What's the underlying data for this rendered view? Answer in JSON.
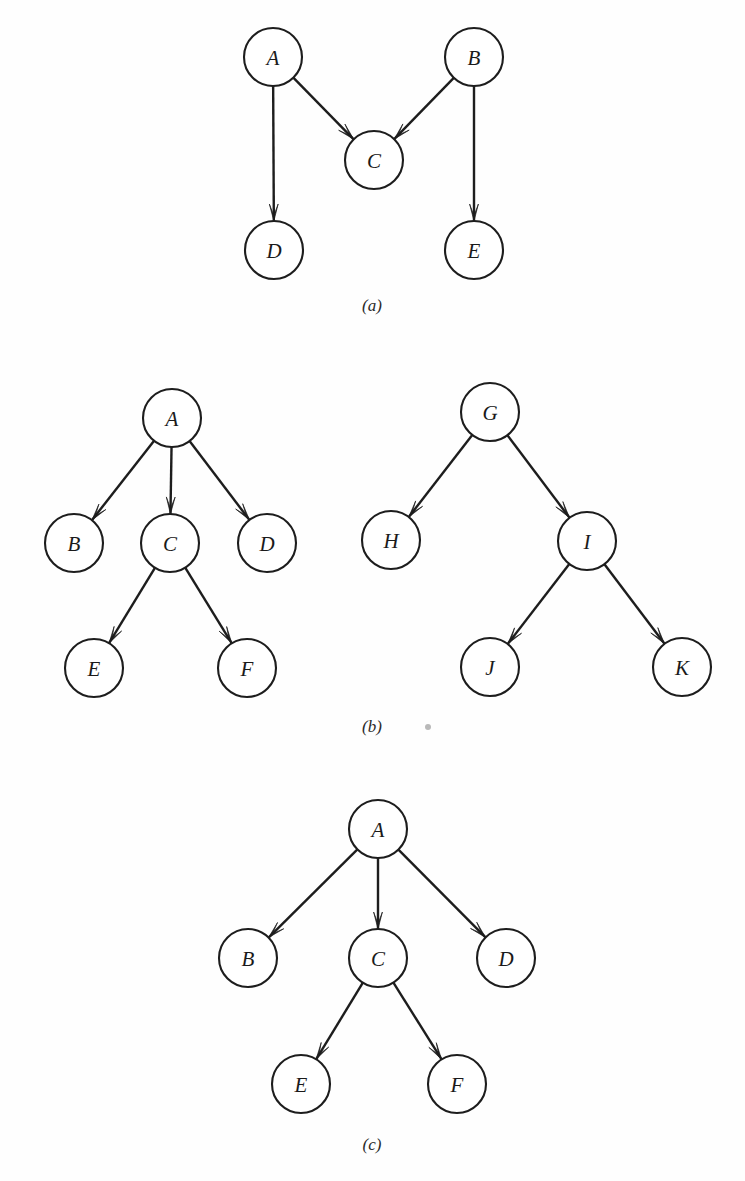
{
  "figure": {
    "background_color": "#fefefe",
    "ink_color": "#1d1d1d",
    "node_radius": 29,
    "panels": [
      {
        "id": "panel-a",
        "caption": "(a)",
        "caption_x": 372,
        "caption_y": 305,
        "description": "directed acyclic graph",
        "nodes": [
          {
            "id": "A",
            "label": "A",
            "cx": 273,
            "cy": 57
          },
          {
            "id": "B",
            "label": "B",
            "cx": 474,
            "cy": 57
          },
          {
            "id": "C",
            "label": "C",
            "cx": 374,
            "cy": 160
          },
          {
            "id": "D",
            "label": "D",
            "cx": 274,
            "cy": 250
          },
          {
            "id": "E",
            "label": "E",
            "cx": 474,
            "cy": 250
          }
        ],
        "edges": [
          {
            "from": "A",
            "to": "C"
          },
          {
            "from": "A",
            "to": "D"
          },
          {
            "from": "B",
            "to": "C"
          },
          {
            "from": "B",
            "to": "E"
          }
        ]
      },
      {
        "id": "panel-b",
        "caption": "(b)",
        "caption_x": 372,
        "caption_y": 726,
        "description": "two separate rooted trees",
        "nodes": [
          {
            "id": "A",
            "label": "A",
            "cx": 172,
            "cy": 418
          },
          {
            "id": "B",
            "label": "B",
            "cx": 74,
            "cy": 543
          },
          {
            "id": "C",
            "label": "C",
            "cx": 170,
            "cy": 543
          },
          {
            "id": "D",
            "label": "D",
            "cx": 267,
            "cy": 543
          },
          {
            "id": "E",
            "label": "E",
            "cx": 94,
            "cy": 668
          },
          {
            "id": "F",
            "label": "F",
            "cx": 247,
            "cy": 668
          },
          {
            "id": "G",
            "label": "G",
            "cx": 490,
            "cy": 412
          },
          {
            "id": "H",
            "label": "H",
            "cx": 391,
            "cy": 540
          },
          {
            "id": "I",
            "label": "I",
            "cx": 587,
            "cy": 541
          },
          {
            "id": "J",
            "label": "J",
            "cx": 490,
            "cy": 667
          },
          {
            "id": "K",
            "label": "K",
            "cx": 682,
            "cy": 667
          }
        ],
        "edges": [
          {
            "from": "A",
            "to": "B"
          },
          {
            "from": "A",
            "to": "C"
          },
          {
            "from": "A",
            "to": "D"
          },
          {
            "from": "C",
            "to": "E"
          },
          {
            "from": "C",
            "to": "F"
          },
          {
            "from": "G",
            "to": "H"
          },
          {
            "from": "G",
            "to": "I"
          },
          {
            "from": "I",
            "to": "J"
          },
          {
            "from": "I",
            "to": "K"
          }
        ]
      },
      {
        "id": "panel-c",
        "caption": "(c)",
        "caption_x": 372,
        "caption_y": 1144,
        "description": "single rooted tree",
        "nodes": [
          {
            "id": "A",
            "label": "A",
            "cx": 378,
            "cy": 829
          },
          {
            "id": "B",
            "label": "B",
            "cx": 248,
            "cy": 958
          },
          {
            "id": "C",
            "label": "C",
            "cx": 378,
            "cy": 958
          },
          {
            "id": "D",
            "label": "D",
            "cx": 506,
            "cy": 958
          },
          {
            "id": "E",
            "label": "E",
            "cx": 301,
            "cy": 1084
          },
          {
            "id": "F",
            "label": "F",
            "cx": 457,
            "cy": 1084
          }
        ],
        "edges": [
          {
            "from": "A",
            "to": "B"
          },
          {
            "from": "A",
            "to": "C"
          },
          {
            "from": "A",
            "to": "D"
          },
          {
            "from": "C",
            "to": "E"
          },
          {
            "from": "C",
            "to": "F"
          }
        ]
      }
    ],
    "artifacts": [
      {
        "id": "scan-speck",
        "cx": 428,
        "cy": 727,
        "r": 3
      }
    ]
  }
}
